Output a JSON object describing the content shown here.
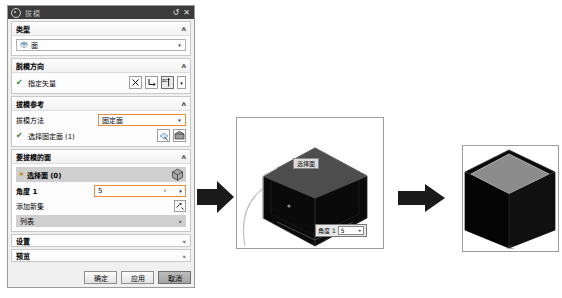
{
  "dialog": {
    "title": "拔模",
    "icon": "draft-icon",
    "reset_label": "↺",
    "close_label": "✕",
    "sections": {
      "type": {
        "header": "类型",
        "chevron": "ᴧ",
        "value": "面",
        "value_icon": "face-icon"
      },
      "direction": {
        "header": "脱模方向",
        "chevron": "ᴧ",
        "vector_label": "指定矢量",
        "buttons": [
          {
            "name": "vector-cross-button",
            "glyph": "✗"
          },
          {
            "name": "vector-reverse-button",
            "glyph": "⤴"
          },
          {
            "name": "vector-zc-button",
            "glyph": "ZC"
          },
          {
            "name": "vector-dropdown-button",
            "glyph": "▾"
          }
        ]
      },
      "reference": {
        "header": "拔模参考",
        "chevron": "ᴧ",
        "method_label": "拔模方法",
        "method_value": "固定面",
        "select_label": "选择固定面 (1)",
        "buttons": [
          {
            "name": "select-face-button",
            "glyph": "face"
          },
          {
            "name": "stationary-face-button",
            "glyph": "cube"
          }
        ]
      },
      "faces": {
        "header": "要拔模的面",
        "chevron": "ᴧ",
        "select_label": "选择面 (0)",
        "cube_button": "face-picker-icon",
        "angle_label": "角度 1",
        "angle_value": "5",
        "angle_unit": "°",
        "angle_arrow": "▾",
        "add_set_label": "添加新集",
        "add_set_button": "add-new-set-icon",
        "list_label": "列表",
        "list_chevron": "ᵥ"
      },
      "settings": {
        "header": "设置",
        "chevron": "ᵥ"
      },
      "preview": {
        "header": "预览",
        "chevron": "ᵥ"
      }
    },
    "footer": {
      "ok": "确定",
      "apply": "应用",
      "cancel": "取消"
    }
  },
  "viewport_middle": {
    "name": "draft-preview-viewport",
    "tooltip": "选择面",
    "angle_label": "角度 1",
    "angle_value": "5",
    "angle_arrow": "▾"
  },
  "viewport_right": {
    "name": "draft-result-viewport",
    "caption": "XC"
  },
  "arrows": [
    {
      "name": "arrow-dialog-to-preview"
    },
    {
      "name": "arrow-preview-to-result"
    }
  ],
  "colors": {
    "accent": "#ea8b3a",
    "title_bg": "#3b3b3b",
    "panel_bg": "#f0f0f0",
    "selection_bg": "#cfcfcf"
  }
}
